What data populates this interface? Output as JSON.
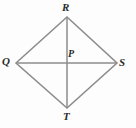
{
  "figure": {
    "kind": "rhombus-with-diagonals",
    "background_color": "#fdfdfd",
    "stroke_color": "#8d8d8d",
    "stroke_width": 1.6,
    "label_color": "#2b2b2b",
    "vertices": {
      "top": {
        "label": "R",
        "x": 67,
        "y": 17
      },
      "left": {
        "label": "Q",
        "x": 16,
        "y": 63
      },
      "right": {
        "label": "S",
        "x": 117,
        "y": 63
      },
      "bottom": {
        "label": "T",
        "x": 67,
        "y": 108
      }
    },
    "center": {
      "label": "P",
      "x": 67,
      "y": 63
    },
    "sides": [
      {
        "name": "QR",
        "from": "Q",
        "to": "R"
      },
      {
        "name": "RS",
        "from": "R",
        "to": "S"
      },
      {
        "name": "ST",
        "from": "S",
        "to": "T"
      },
      {
        "name": "TQ",
        "from": "T",
        "to": "Q"
      }
    ],
    "diagonals": [
      {
        "name": "QS",
        "from": "Q",
        "to": "S",
        "orientation": "horizontal"
      },
      {
        "name": "RT",
        "from": "R",
        "to": "T",
        "orientation": "vertical"
      }
    ]
  }
}
